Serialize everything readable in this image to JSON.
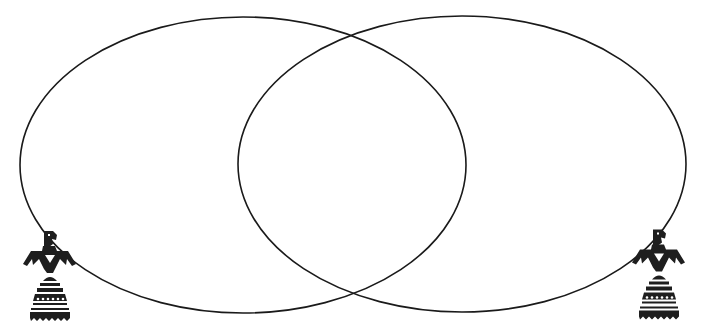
{
  "diagram": {
    "type": "venn",
    "background": "#ffffff",
    "stroke_color": "#1a1a1a",
    "sets": [
      {
        "id": "left",
        "label": "",
        "cx": 243,
        "cy": 165,
        "rx": 223,
        "ry": 148
      },
      {
        "id": "right",
        "label": "",
        "cx": 462,
        "cy": 164,
        "rx": 224,
        "ry": 148
      }
    ],
    "decorations": [
      {
        "icon": "thunderbird-icon",
        "position": "bottom-left",
        "x": 22,
        "y": 229,
        "width": 56,
        "height": 94
      },
      {
        "icon": "thunderbird-icon",
        "position": "bottom-right",
        "x": 631,
        "y": 227,
        "width": 56,
        "height": 95
      }
    ],
    "figure_color": "#1e1e1e"
  }
}
